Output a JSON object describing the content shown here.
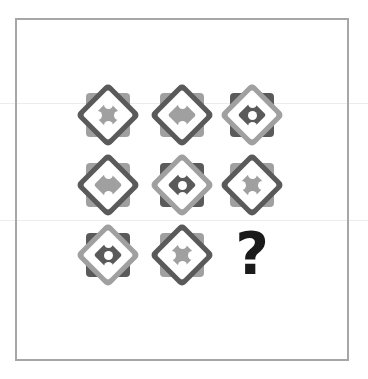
{
  "puzzle": {
    "colors": {
      "dark": "#5a5a5a",
      "light": "#a0a0a0",
      "dot": "#ffffff",
      "frame": "#a6a6a6",
      "question": "#1a1a1a"
    },
    "grid": [
      [
        {
          "style": "dark-outer",
          "pips": 4
        },
        {
          "style": "dark-outer",
          "pips": 2
        },
        {
          "style": "light-outer",
          "pips": 3
        }
      ],
      [
        {
          "style": "dark-outer",
          "pips": 2
        },
        {
          "style": "light-outer",
          "pips": 3
        },
        {
          "style": "dark-outer",
          "pips": 4
        }
      ],
      [
        {
          "style": "light-outer",
          "pips": 3
        },
        {
          "style": "dark-outer",
          "pips": 4
        },
        {
          "style": "missing",
          "pips": null
        }
      ]
    ],
    "missing_label": "?"
  }
}
